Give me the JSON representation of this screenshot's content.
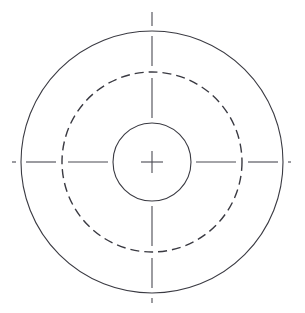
{
  "canvas": {
    "width": 305,
    "height": 313,
    "background_color": "#ffffff",
    "title": "Concentric Circles Technical Drawing"
  },
  "style": {
    "object_line_color": "#3a3a42",
    "object_line_width": 1.1,
    "hidden_line_color": "#3a3a42",
    "hidden_line_width": 1.4,
    "center_line_color": "#4a4a52",
    "center_line_width": 1.1,
    "hidden_dash_pattern": "9 5",
    "center_dash_pattern": "none"
  },
  "geometry": {
    "center": {
      "x": 152,
      "y": 162
    },
    "circles": [
      {
        "name": "outer-circle",
        "radius": 131,
        "line_type": "solid",
        "role": "outer boundary / visible edge"
      },
      {
        "name": "hidden-circle",
        "radius": 90,
        "line_type": "dashed",
        "role": "hidden feature / bolt circle"
      },
      {
        "name": "inner-circle",
        "radius": 39,
        "line_type": "solid",
        "role": "central bore / hole"
      }
    ],
    "center_lines": {
      "horizontal": {
        "x1": 12,
        "x2": 291,
        "y": 162
      },
      "vertical": {
        "y1": 12,
        "y2": 303,
        "x": 152
      }
    }
  },
  "chart_data": {
    "type": "scatter",
    "xlabel": "",
    "ylabel": "",
    "series": [
      {
        "name": "outer-circle",
        "radius": 131,
        "cx": 152,
        "cy": 162,
        "linestyle": "solid"
      },
      {
        "name": "hidden-circle",
        "radius": 90,
        "cx": 152,
        "cy": 162,
        "linestyle": "dashed"
      },
      {
        "name": "inner-circle",
        "radius": 39,
        "cx": 152,
        "cy": 162,
        "linestyle": "solid"
      }
    ],
    "annotations": []
  }
}
